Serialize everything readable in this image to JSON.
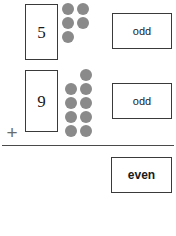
{
  "worksheet": {
    "title": "odd plus odd equals even",
    "background_color": "#ffffff",
    "ink_color": "#3a3a3a",
    "dot_color": "#8a8a8a",
    "operator": "+",
    "rule_label": "sum-line"
  },
  "addends": [
    {
      "numeral": "5",
      "parity": "odd",
      "dot_count": 5,
      "dot_rows": [
        2,
        2,
        1
      ],
      "pairs": 2,
      "leftover": 1
    },
    {
      "numeral": "9",
      "parity": "odd",
      "dot_count": 9,
      "dot_rows": [
        1,
        2,
        2,
        2,
        2
      ],
      "pairs": 4,
      "leftover": 1
    }
  ],
  "sum": {
    "parity": "even",
    "total": 14
  },
  "chart_data": {
    "type": "bar",
    "categories": [
      "5",
      "9"
    ],
    "values": [
      5,
      9
    ],
    "series": [
      {
        "name": "dots",
        "values": [
          5,
          9
        ]
      }
    ],
    "annotations": [
      "odd",
      "odd",
      "even"
    ],
    "xlabel": "",
    "ylabel": "",
    "ylim": [
      0,
      10
    ],
    "grid": false,
    "legend": "none"
  }
}
